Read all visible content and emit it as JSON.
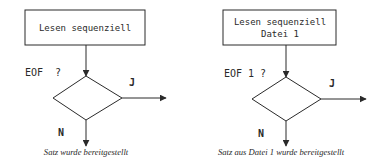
{
  "diagrams": [
    {
      "process_box": {
        "line1": "Lesen sequenziell",
        "line2": ""
      },
      "decision_label": "EOF  ?",
      "yes_label": "J",
      "no_label": "N",
      "caption": "Satz wurde bereitgestellt"
    },
    {
      "process_box": {
        "line1": "Lesen sequenziell",
        "line2": "Datei 1"
      },
      "decision_label": "EOF 1 ?",
      "yes_label": "J",
      "no_label": "N",
      "caption": "Satz aus Datei 1 wurde bereitgestellt"
    }
  ],
  "colors": {
    "stroke": "#2a2a2a",
    "background": "#ffffff"
  }
}
